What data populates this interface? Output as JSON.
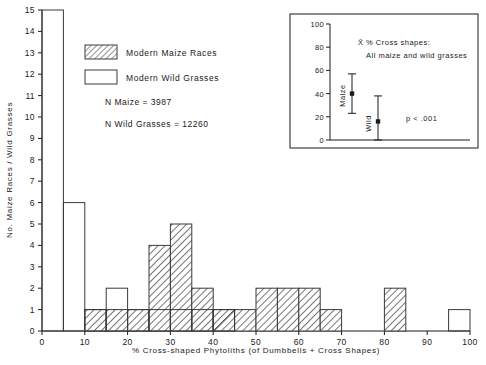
{
  "chart_data": {
    "type": "bar",
    "title": "",
    "xlabel": "% Cross-shaped Phytoliths (of Dumbbells + Cross Shapes)",
    "ylabel": "No. Maize Races / Wild Grasses",
    "xlim": [
      0,
      100
    ],
    "ylim": [
      0,
      15
    ],
    "bin_width": 5,
    "grid": false,
    "legend_position": "upper-left-inside",
    "x_ticks": [
      0,
      10,
      20,
      30,
      40,
      50,
      60,
      70,
      80,
      90,
      100
    ],
    "y_ticks": [
      0,
      1,
      2,
      3,
      4,
      5,
      6,
      7,
      8,
      9,
      10,
      11,
      12,
      13,
      14,
      15
    ],
    "bin_starts": [
      0,
      5,
      10,
      15,
      20,
      25,
      30,
      35,
      40,
      45,
      50,
      55,
      60,
      65,
      70,
      75,
      80,
      85,
      90,
      95
    ],
    "series": [
      {
        "name": "Modern Maize Races",
        "style": "hatched",
        "values": [
          0,
          0,
          1,
          1,
          1,
          4,
          5,
          2,
          1,
          1,
          2,
          2,
          2,
          1,
          0,
          0,
          2,
          0,
          0,
          0
        ]
      },
      {
        "name": "Modern Wild Grasses",
        "style": "open",
        "values": [
          15,
          6,
          1,
          2,
          1,
          1,
          1,
          1,
          1,
          0,
          0,
          0,
          0,
          0,
          0,
          0,
          0,
          0,
          0,
          1
        ]
      }
    ],
    "annotations": [
      "N Maize = 3987",
      "N Wild Grasses = 12260"
    ],
    "inset": {
      "type": "scatter",
      "title_line1": "X̄ % Cross shapes:",
      "title_line2": "All maize and wild grasses",
      "ylim": [
        0,
        100
      ],
      "y_ticks": [
        0,
        20,
        40,
        60,
        80,
        100
      ],
      "significance": "p < .001",
      "points": [
        {
          "label": "Maize",
          "mean": 40,
          "low": 23,
          "high": 57
        },
        {
          "label": "Wild",
          "mean": 16,
          "low": 0,
          "high": 38
        }
      ]
    }
  },
  "legend": {
    "items": [
      {
        "label": "Modern Maize Races",
        "swatch": "hatched"
      },
      {
        "label": "Modern Wild Grasses",
        "swatch": "open"
      }
    ],
    "counts": [
      "N Maize = 3987",
      "N Wild Grasses = 12260"
    ]
  },
  "axes": {
    "x_title": "% Cross-shaped Phytoliths (of Dumbbells + Cross Shapes)",
    "y_title": "No. Maize Races / Wild Grasses",
    "x_tick_labels": [
      "0",
      "10",
      "20",
      "30",
      "40",
      "50",
      "60",
      "70",
      "80",
      "90",
      "100"
    ],
    "y_tick_labels": [
      "0",
      "1",
      "2",
      "3",
      "4",
      "5",
      "6",
      "7",
      "8",
      "9",
      "10",
      "11",
      "12",
      "13",
      "14",
      "15"
    ]
  },
  "inset_text": {
    "title_line1": "X̄ % Cross shapes:",
    "title_line2": "All maize and wild grasses",
    "pvalue": "p < .001",
    "y_tick_labels": [
      "0",
      "20",
      "40",
      "60",
      "80",
      "100"
    ],
    "group_labels": [
      "Maize",
      "Wild"
    ]
  },
  "colors": {
    "ink": "#1a1a1a",
    "bar_stroke": "#3a3a3a",
    "background": "#ffffff"
  }
}
